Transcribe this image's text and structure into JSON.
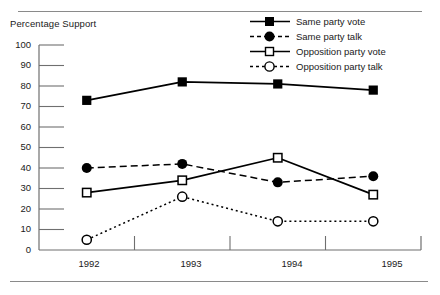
{
  "chart_data": {
    "type": "line",
    "title": "",
    "ylabel": "Percentage Support",
    "xlabel": "",
    "categories": [
      "1992",
      "1993",
      "1994",
      "1995"
    ],
    "ylim": [
      0,
      100
    ],
    "yticks": [
      0,
      10,
      20,
      30,
      40,
      50,
      60,
      70,
      80,
      90,
      100
    ],
    "grid": false,
    "legend_position": "top-right",
    "series": [
      {
        "name": "Same party vote",
        "marker": "filled-square",
        "line_style": "solid",
        "color": "#000000",
        "values": [
          73,
          82,
          81,
          78
        ]
      },
      {
        "name": "Same party talk",
        "marker": "filled-circle",
        "line_style": "dashed",
        "color": "#000000",
        "values": [
          40,
          42,
          33,
          36
        ]
      },
      {
        "name": "Opposition party vote",
        "marker": "open-square",
        "line_style": "solid",
        "color": "#000000",
        "values": [
          28,
          34,
          45,
          27
        ]
      },
      {
        "name": "Opposition party talk",
        "marker": "open-circle",
        "line_style": "dotted",
        "color": "#000000",
        "values": [
          5,
          26,
          14,
          14
        ]
      }
    ]
  },
  "axis": {
    "ylabel": "Percentage Support",
    "yticks": [
      "100",
      "90",
      "80",
      "70",
      "60",
      "50",
      "40",
      "30",
      "20",
      "10",
      "0"
    ],
    "xticks": [
      "1992",
      "1993",
      "1994",
      "1995"
    ]
  },
  "legend": {
    "items": [
      {
        "label": "Same party vote",
        "marker": "filled-square",
        "line": "solid"
      },
      {
        "label": "Same party talk",
        "marker": "filled-circle",
        "line": "dashed"
      },
      {
        "label": "Opposition party vote",
        "marker": "open-square",
        "line": "solid"
      },
      {
        "label": "Opposition party talk",
        "marker": "open-circle",
        "line": "dotted"
      }
    ]
  },
  "colors": {
    "ink": "#000000",
    "axis": "#6f6f6f",
    "rule": "#8a8a8a",
    "background": "#ffffff"
  }
}
